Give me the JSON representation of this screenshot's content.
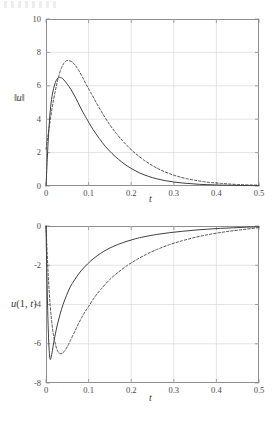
{
  "figure": {
    "background_color": "#ffffff",
    "line_color": "#3f3f3f",
    "grid_color": "#d9d9d9",
    "frame_color": "#8e8e8e",
    "scan_artifact_label": "scan-noise"
  },
  "chart_data": [
    {
      "type": "line",
      "panel": "top",
      "title": "",
      "xlabel": "t",
      "ylabel": "‖u‖",
      "ylabel_parts": {
        "bar_left": "‖",
        "var": "u",
        "bar_right": "‖"
      },
      "xlim": [
        0,
        0.5
      ],
      "ylim": [
        0,
        10
      ],
      "grid": true,
      "legend": null,
      "xticks": [
        0,
        0.1,
        0.2,
        0.3,
        0.4,
        0.5
      ],
      "xtick_labels": [
        "0",
        "0.1",
        "0.2",
        "0.3",
        "0.4",
        "0.5"
      ],
      "yticks": [
        0,
        2,
        4,
        6,
        8,
        10
      ],
      "ytick_labels": [
        "0",
        "2",
        "4",
        "6",
        "8",
        "10"
      ],
      "series": [
        {
          "name": "solid",
          "style": "solid",
          "x": [
            0,
            0.003,
            0.006,
            0.01,
            0.014,
            0.018,
            0.022,
            0.026,
            0.03,
            0.034,
            0.038,
            0.042,
            0.05,
            0.058,
            0.066,
            0.075,
            0.085,
            0.095,
            0.11,
            0.125,
            0.14,
            0.155,
            0.17,
            0.185,
            0.2,
            0.22,
            0.24,
            0.26,
            0.28,
            0.3,
            0.32,
            0.34,
            0.36,
            0.38,
            0.4,
            0.42,
            0.44,
            0.46,
            0.48,
            0.5
          ],
          "y": [
            0.0,
            1.6,
            3.1,
            4.5,
            5.35,
            5.85,
            6.2,
            6.4,
            6.5,
            6.5,
            6.45,
            6.35,
            6.1,
            5.8,
            5.45,
            5.0,
            4.5,
            4.05,
            3.4,
            2.85,
            2.35,
            1.95,
            1.6,
            1.3,
            1.05,
            0.78,
            0.58,
            0.43,
            0.32,
            0.24,
            0.18,
            0.14,
            0.1,
            0.08,
            0.06,
            0.05,
            0.04,
            0.03,
            0.025,
            0.02
          ]
        },
        {
          "name": "dashed",
          "style": "dashed",
          "x": [
            0,
            0.004,
            0.008,
            0.013,
            0.018,
            0.024,
            0.03,
            0.036,
            0.042,
            0.048,
            0.054,
            0.06,
            0.068,
            0.076,
            0.085,
            0.095,
            0.105,
            0.12,
            0.135,
            0.15,
            0.165,
            0.18,
            0.195,
            0.21,
            0.23,
            0.25,
            0.27,
            0.29,
            0.31,
            0.33,
            0.35,
            0.37,
            0.39,
            0.41,
            0.43,
            0.45,
            0.47,
            0.5
          ],
          "y": [
            2.2,
            2.9,
            3.6,
            4.45,
            5.2,
            5.95,
            6.6,
            7.05,
            7.35,
            7.5,
            7.5,
            7.45,
            7.25,
            6.95,
            6.55,
            6.05,
            5.6,
            4.9,
            4.25,
            3.65,
            3.15,
            2.7,
            2.3,
            1.95,
            1.55,
            1.22,
            0.95,
            0.74,
            0.57,
            0.44,
            0.34,
            0.26,
            0.2,
            0.16,
            0.12,
            0.09,
            0.07,
            0.05
          ]
        }
      ]
    },
    {
      "type": "line",
      "panel": "bottom",
      "title": "",
      "xlabel": "t",
      "ylabel": "u(1, t)",
      "ylabel_parts": {
        "var": "u",
        "open": "(",
        "arg1": "1",
        "comma": ", ",
        "arg2": "t",
        "close": ")"
      },
      "xlim": [
        0,
        0.5
      ],
      "ylim": [
        -8,
        0
      ],
      "grid": true,
      "legend": null,
      "xticks": [
        0,
        0.1,
        0.2,
        0.3,
        0.4,
        0.5
      ],
      "xtick_labels": [
        "0",
        "0.1",
        "0.2",
        "0.3",
        "0.4",
        "0.5"
      ],
      "yticks": [
        -8,
        -6,
        -4,
        -2,
        0
      ],
      "ytick_labels": [
        "-8",
        "-6",
        "-4",
        "-2",
        "0"
      ],
      "series": [
        {
          "name": "solid",
          "style": "solid",
          "x": [
            0,
            0.002,
            0.004,
            0.006,
            0.008,
            0.01,
            0.012,
            0.015,
            0.018,
            0.022,
            0.027,
            0.033,
            0.04,
            0.048,
            0.057,
            0.067,
            0.078,
            0.09,
            0.105,
            0.12,
            0.135,
            0.15,
            0.17,
            0.19,
            0.21,
            0.23,
            0.26,
            0.29,
            0.32,
            0.35,
            0.38,
            0.41,
            0.44,
            0.47,
            0.5
          ],
          "y": [
            0.0,
            -2.4,
            -4.3,
            -5.7,
            -6.5,
            -6.8,
            -6.7,
            -6.35,
            -5.95,
            -5.5,
            -5.0,
            -4.5,
            -4.0,
            -3.55,
            -3.1,
            -2.75,
            -2.4,
            -2.1,
            -1.78,
            -1.52,
            -1.3,
            -1.12,
            -0.93,
            -0.78,
            -0.65,
            -0.55,
            -0.43,
            -0.34,
            -0.27,
            -0.21,
            -0.16,
            -0.12,
            -0.09,
            -0.06,
            -0.04
          ]
        },
        {
          "name": "dashed",
          "style": "dashed",
          "x": [
            0,
            0.003,
            0.006,
            0.01,
            0.014,
            0.018,
            0.023,
            0.028,
            0.033,
            0.038,
            0.044,
            0.05,
            0.058,
            0.067,
            0.077,
            0.088,
            0.1,
            0.115,
            0.13,
            0.15,
            0.17,
            0.19,
            0.21,
            0.235,
            0.26,
            0.29,
            0.32,
            0.35,
            0.38,
            0.41,
            0.44,
            0.47,
            0.5
          ],
          "y": [
            0.0,
            -1.5,
            -2.8,
            -4.1,
            -5.0,
            -5.6,
            -6.1,
            -6.4,
            -6.5,
            -6.5,
            -6.35,
            -6.15,
            -5.8,
            -5.4,
            -4.95,
            -4.5,
            -4.1,
            -3.6,
            -3.2,
            -2.72,
            -2.35,
            -2.02,
            -1.75,
            -1.45,
            -1.2,
            -0.95,
            -0.75,
            -0.58,
            -0.44,
            -0.33,
            -0.24,
            -0.16,
            -0.08
          ]
        }
      ]
    }
  ]
}
